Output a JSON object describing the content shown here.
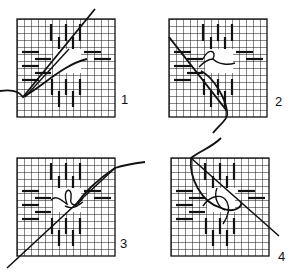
{
  "diagram": {
    "colors": {
      "ink": "#111111",
      "background": "#ffffff"
    },
    "grid": {
      "columns": 14,
      "rows": 14,
      "cell_px": 7
    },
    "panels": [
      {
        "step": "1",
        "x": 17,
        "y": 19,
        "label_x": 121,
        "label_y": 92
      },
      {
        "step": "2",
        "x": 169,
        "y": 19,
        "label_x": 275,
        "label_y": 94
      },
      {
        "step": "3",
        "x": 17,
        "y": 158,
        "label_x": 120,
        "label_y": 236
      },
      {
        "step": "4",
        "x": 171,
        "y": 158,
        "label_x": 278,
        "label_y": 249
      }
    ]
  }
}
